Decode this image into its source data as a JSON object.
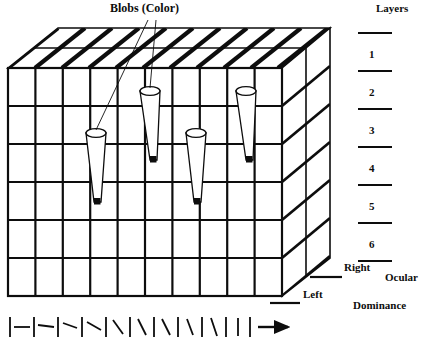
{
  "figure": {
    "type": "diagram",
    "background_color": "#ffffff",
    "ink_color": "#0d0d0d"
  },
  "labels": {
    "blobs": "Blobs (Color)",
    "layers": "Layers",
    "right": "Right",
    "left": "Left",
    "ocular": "Ocular",
    "dominance": "Dominance"
  },
  "layers": {
    "title": "Layers",
    "numbers": [
      "1",
      "2",
      "3",
      "4",
      "5",
      "6"
    ],
    "tick_count": 7
  },
  "ocular_dominance": {
    "entries": [
      {
        "label": "Right"
      },
      {
        "label": "Left"
      }
    ],
    "caption_line1": "Ocular",
    "caption_line2": "Dominance"
  },
  "cube": {
    "front_columns": 10,
    "front_rows": 6,
    "side_layer_bands": 6,
    "top_slab_count": 10
  },
  "blobs": {
    "count": 4,
    "label": "Blobs (Color)",
    "leader_lines": 2
  },
  "orientation_bar": {
    "description": "sequence of oriented line segments separated by vertical bars, progressing from horizontal to vertical",
    "segment_count": 10,
    "angles_deg": [
      0,
      8,
      18,
      28,
      42,
      55,
      64,
      72,
      80,
      90
    ],
    "arrow": "right-arrow"
  }
}
